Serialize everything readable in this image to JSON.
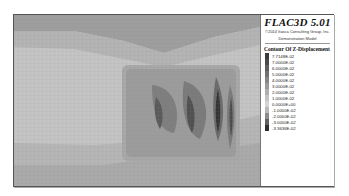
{
  "legend": {
    "title": "FLAC3D 5.01",
    "copyright": "©2014 Itasca Consulting Group, Inc.",
    "subtitle": "Demonstration Model",
    "contour_title": "Contour Of Z-Displacement",
    "entries": [
      {
        "label": "7.7148E-02",
        "color": "#3a3a3a"
      },
      {
        "label": "7.0000E-02",
        "color": "#4a4a4a"
      },
      {
        "label": "6.0000E-02",
        "color": "#5e5e5e"
      },
      {
        "label": "5.0000E-02",
        "color": "#727272"
      },
      {
        "label": "4.0000E-02",
        "color": "#868686"
      },
      {
        "label": "3.0000E-02",
        "color": "#9a9a9a"
      },
      {
        "label": "2.0000E-02",
        "color": "#aeaeae"
      },
      {
        "label": "1.0000E-02",
        "color": "#c2c2c2"
      },
      {
        "label": "0.0000E+00",
        "color": "#d4d4d4"
      },
      {
        "label": "-1.0000E-02",
        "color": "#b8b8b8"
      },
      {
        "label": "-2.0000E-02",
        "color": "#8c8c8c"
      },
      {
        "label": "-3.0000E-02",
        "color": "#606060"
      },
      {
        "label": "-3.3636E-02",
        "color": "#2e2e2e"
      }
    ]
  }
}
